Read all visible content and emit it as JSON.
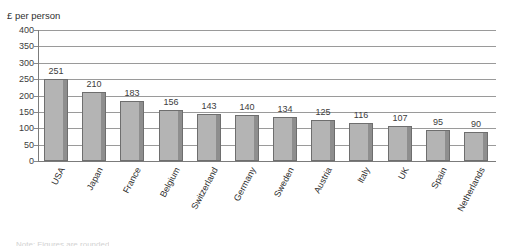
{
  "chart_data": {
    "type": "bar",
    "title": "",
    "subtitle": "",
    "ylabel": "£ per person",
    "xlabel": "",
    "ylim": [
      0,
      400
    ],
    "ytick_step": 50,
    "yticks": [
      "0",
      "50",
      "100",
      "150",
      "200",
      "250",
      "300",
      "350",
      "400"
    ],
    "grid": true,
    "legend": "none",
    "orientation": "vertical",
    "bar_label_position": "above",
    "categories": [
      "USA",
      "Japan",
      "France",
      "Belgium",
      "Switzerland",
      "Germany",
      "Sweden",
      "Austria",
      "Italy",
      "UK",
      "Spain",
      "Netherlands"
    ],
    "values": [
      251,
      210,
      183,
      156,
      143,
      140,
      134,
      125,
      116,
      107,
      95,
      90
    ],
    "value_labels": [
      "251",
      "210",
      "183",
      "156",
      "143",
      "140",
      "134",
      "125",
      "116",
      "107",
      "95",
      "90"
    ],
    "colors": {
      "bar_face": "#b4b4b4",
      "bar_side": "#8e8e8e",
      "bar_outline": "#6e6e6e",
      "gridline": "#9a9a9a",
      "axis": "#7b7b7b",
      "text": "#3c3c3c",
      "background": "#ffffff"
    }
  },
  "footnote": {
    "text": "Note: Figures are rounded"
  }
}
